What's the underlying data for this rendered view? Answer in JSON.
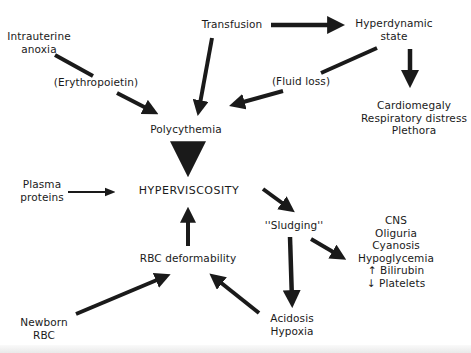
{
  "diagram": {
    "type": "flow-diagram",
    "nodes": {
      "intrauterine_anoxia": {
        "lines": [
          "Intrauterine",
          "anoxia"
        ]
      },
      "transfusion": {
        "lines": [
          "Transfusion"
        ]
      },
      "hyperdynamic_state": {
        "lines": [
          "Hyperdynamic",
          "state"
        ]
      },
      "erythropoietin": {
        "lines": [
          "(Erythropoietin)"
        ]
      },
      "fluid_loss": {
        "lines": [
          "(Fluid loss)"
        ]
      },
      "hyperdynamic_effects": {
        "lines": [
          "Cardiomegaly",
          "Respiratory distress",
          "Plethora"
        ]
      },
      "polycythemia": {
        "lines": [
          "Polycythemia"
        ]
      },
      "plasma_proteins": {
        "lines": [
          "Plasma",
          "proteins"
        ]
      },
      "hyperviscosity": {
        "lines": [
          "HYPERVISCOSITY"
        ]
      },
      "sludging": {
        "lines": [
          "''Sludging''"
        ]
      },
      "sludging_effects": {
        "lines": [
          "CNS",
          "Oliguria",
          "Cyanosis",
          "Hypoglycemia",
          "↑ Bilirubin",
          "↓ Platelets"
        ]
      },
      "rbc_deformability": {
        "lines": [
          "RBC deformability"
        ]
      },
      "newborn_rbc": {
        "lines": [
          "Newborn",
          "RBC"
        ]
      },
      "acidosis_hypoxia": {
        "lines": [
          "Acidosis",
          "Hypoxia"
        ]
      }
    },
    "edges": [
      {
        "from": "Intrauterine anoxia",
        "to": "Polycythemia",
        "label": "(Erythropoietin)"
      },
      {
        "from": "Transfusion",
        "to": "Polycythemia"
      },
      {
        "from": "Transfusion",
        "to": "Hyperdynamic state"
      },
      {
        "from": "Hyperdynamic state",
        "to": "Polycythemia",
        "label": "(Fluid loss)"
      },
      {
        "from": "Hyperdynamic state",
        "to": "Cardiomegaly / Respiratory distress / Plethora"
      },
      {
        "from": "Polycythemia",
        "to": "HYPERVISCOSITY",
        "weight": "heavy"
      },
      {
        "from": "Plasma proteins",
        "to": "HYPERVISCOSITY",
        "weight": "thin"
      },
      {
        "from": "RBC deformability",
        "to": "HYPERVISCOSITY"
      },
      {
        "from": "HYPERVISCOSITY",
        "to": "Sludging"
      },
      {
        "from": "Sludging",
        "to": "CNS / Oliguria / Cyanosis / Hypoglycemia / ↑ Bilirubin / ↓ Platelets"
      },
      {
        "from": "Sludging",
        "to": "Acidosis / Hypoxia"
      },
      {
        "from": "Newborn RBC",
        "to": "RBC deformability"
      },
      {
        "from": "Acidosis / Hypoxia",
        "to": "RBC deformability"
      }
    ],
    "colors": {
      "ink": "#1a1a1a",
      "background": "#ffffff"
    }
  }
}
